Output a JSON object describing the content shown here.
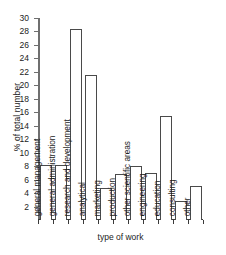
{
  "chart_data": {
    "type": "bar",
    "title": "",
    "xlabel": "type of work",
    "ylabel": "% of total number",
    "categories": [
      "general management",
      "general administration",
      "research and development",
      "analytical",
      "marketing",
      "production",
      "other scientific areas",
      "engineering",
      "education",
      "consulting",
      "other"
    ],
    "values": [
      8.2,
      8.2,
      28.4,
      21.5,
      4.8,
      6.8,
      8.0,
      7.0,
      15.5,
      2.8,
      5.0
    ],
    "ylim": [
      0,
      30
    ],
    "yticks": [
      2,
      4,
      6,
      8,
      10,
      12,
      14,
      16,
      18,
      20,
      22,
      24,
      26,
      28,
      30
    ],
    "ytick_labels": [
      "2",
      "4",
      "6",
      "8",
      "10",
      "12",
      "14",
      "16",
      "18",
      "20",
      "22",
      "24",
      "26",
      "28",
      "30"
    ],
    "grid": false,
    "legend": null,
    "bar_fill": "#ffffff",
    "bar_edge": "#4a4a4a",
    "axis_color": "#6f6f6f",
    "background": "#ffffff"
  }
}
